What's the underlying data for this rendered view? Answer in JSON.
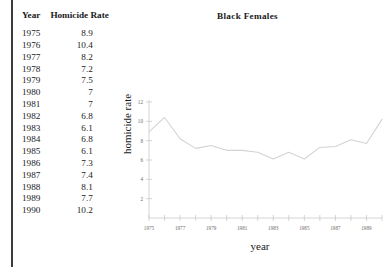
{
  "table": {
    "headers": [
      "Year",
      "Homicide Rate"
    ],
    "rows": [
      {
        "year": "1975",
        "rate": "8.9"
      },
      {
        "year": "1976",
        "rate": "10.4"
      },
      {
        "year": "1977",
        "rate": "8.2"
      },
      {
        "year": "1978",
        "rate": "7.2"
      },
      {
        "year": "1979",
        "rate": "7.5"
      },
      {
        "year": "1980",
        "rate": "7"
      },
      {
        "year": "1981",
        "rate": "7"
      },
      {
        "year": "1982",
        "rate": "6.8"
      },
      {
        "year": "1983",
        "rate": "6.1"
      },
      {
        "year": "1984",
        "rate": "6.8"
      },
      {
        "year": "1985",
        "rate": "6.1"
      },
      {
        "year": "1986",
        "rate": "7.3"
      },
      {
        "year": "1987",
        "rate": "7.4"
      },
      {
        "year": "1988",
        "rate": "8.1"
      },
      {
        "year": "1989",
        "rate": "7.7"
      },
      {
        "year": "1990",
        "rate": "10.2"
      }
    ]
  },
  "chart_data": {
    "type": "line",
    "title": "Black Females",
    "xlabel": "year",
    "ylabel": "homicide rate",
    "x": [
      1975,
      1976,
      1977,
      1978,
      1979,
      1980,
      1981,
      1982,
      1983,
      1984,
      1985,
      1986,
      1987,
      1988,
      1989,
      1990
    ],
    "values": [
      8.9,
      10.4,
      8.2,
      7.2,
      7.5,
      7,
      7,
      6.8,
      6.1,
      6.8,
      6.1,
      7.3,
      7.4,
      8.1,
      7.7,
      10.2
    ],
    "series": [
      {
        "name": "Black Females",
        "values": [
          8.9,
          10.4,
          8.2,
          7.2,
          7.5,
          7,
          7,
          6.8,
          6.1,
          6.8,
          6.1,
          7.3,
          7.4,
          8.1,
          7.7,
          10.2
        ]
      }
    ],
    "xlim": [
      1975,
      1990
    ],
    "ylim": [
      0,
      12
    ],
    "xticks": [
      1975,
      1977,
      1979,
      1981,
      1983,
      1985,
      1987,
      1989
    ],
    "xticklabels": [
      "1975",
      "1977",
      "1979",
      "1981",
      "1983",
      "1985",
      "1987",
      "1989"
    ],
    "yticks": [
      2,
      4,
      6,
      8,
      10,
      12
    ],
    "yticklabels": [
      "2",
      "4",
      "6",
      "8",
      "10",
      "12"
    ],
    "grid": false,
    "legend": null,
    "line_color": "#d3d3d3",
    "axis_color": "#c9c9c9"
  },
  "colors": {
    "background": "#ffffff",
    "text": "#1a1a1a",
    "rule": "#3b3b3b",
    "line": "#d3d3d3",
    "axis": "#c9c9c9"
  }
}
